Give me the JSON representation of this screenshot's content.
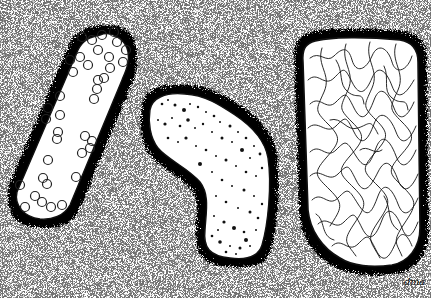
{
  "artwork": {
    "kind": "ink stipple illustration",
    "colors": {
      "paper": "#ffffff",
      "ink": "#111111"
    },
    "cells": [
      {
        "name": "rod-with-circles",
        "pattern": "open circles",
        "circle_count": 38
      },
      {
        "name": "bent-cell-with-dots",
        "pattern": "stippled dots"
      },
      {
        "name": "rectangular-cell-with-filaments",
        "pattern": "tangled lines"
      }
    ],
    "signature": "dma"
  }
}
